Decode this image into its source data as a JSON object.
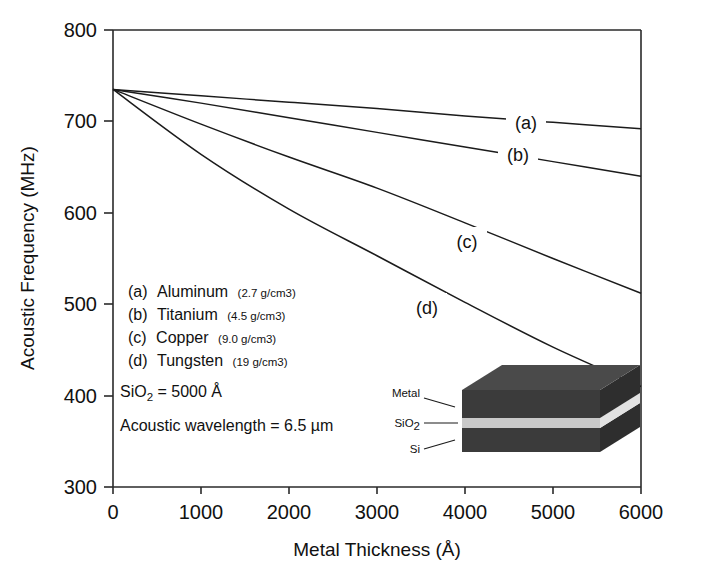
{
  "chart_data": {
    "type": "line",
    "title": "",
    "xlabel": "Metal Thickness (Å)",
    "ylabel": "Acoustic Frequency (MHz)",
    "xlim": [
      0,
      6000
    ],
    "ylim": [
      300,
      800
    ],
    "xticks": [
      "0",
      "1000",
      "2000",
      "3000",
      "4000",
      "5000",
      "6000"
    ],
    "xtick_values": [
      0,
      1000,
      2000,
      3000,
      4000,
      5000,
      6000
    ],
    "yticks": [
      "300",
      "400",
      "500",
      "600",
      "700",
      "800"
    ],
    "ytick_values": [
      300,
      400,
      500,
      600,
      700,
      800
    ],
    "grid": false,
    "legend_position": "inside-left",
    "x": [
      0,
      1000,
      2000,
      3000,
      4000,
      5000,
      6000
    ],
    "series": [
      {
        "name": "Aluminum",
        "key": "a",
        "label": "(a)",
        "density": "2.7 g/cm3",
        "values": [
          735,
          728,
          721,
          714,
          706,
          699,
          692
        ]
      },
      {
        "name": "Titanium",
        "key": "b",
        "label": "(b)",
        "density": "4.5 g/cm3",
        "values": [
          735,
          720,
          704,
          688,
          672,
          656,
          640
        ]
      },
      {
        "name": "Copper",
        "key": "c",
        "label": "(c)",
        "density": "9.0 g/cm3",
        "values": [
          735,
          697,
          661,
          627,
          589,
          550,
          512
        ]
      },
      {
        "name": "Tungsten",
        "key": "d",
        "label": "(d)",
        "density": "19 g/cm3",
        "values": [
          735,
          664,
          604,
          553,
          502,
          453,
          410
        ]
      }
    ],
    "annotations": {
      "oxide_thickness": "SiO2 = 5000 Å",
      "oxide_thickness_prefix": "SiO",
      "oxide_thickness_sub": "2",
      "oxide_thickness_suffix": " = 5000 Å",
      "acoustic_wavelength": "Acoustic wavelength  = 6.5 µm"
    }
  },
  "legend": {
    "entries": [
      {
        "marker": "(a)",
        "material": "Aluminum",
        "density": "(2.7 g/cm3)"
      },
      {
        "marker": "(b)",
        "material": "Titanium",
        "density": "(4.5 g/cm3)"
      },
      {
        "marker": "(c)",
        "material": "Copper",
        "density": "(9.0 g/cm3)"
      },
      {
        "marker": "(d)",
        "material": "Tungsten",
        "density": "(19 g/cm3)"
      }
    ]
  },
  "inset": {
    "name": "layer-stack-diagram",
    "labels": {
      "metal": "Metal",
      "oxide_prefix": "SiO",
      "oxide_sub": "2",
      "substrate": "Si"
    },
    "colors": {
      "metal": "#3b3b3b",
      "metal_top": "#4a4a4a",
      "oxide": "#c9c9c9",
      "substrate": "#3b3b3b",
      "side": "#2e2e2e"
    }
  },
  "curve_labels": {
    "a": "(a)",
    "b": "(b)",
    "c": "(c)",
    "d": "(d)"
  },
  "axis": {
    "x_title": "Metal Thickness (Å)",
    "y_title_prefix": "Acoustic Frequency (MHz)"
  },
  "colors": {
    "ink": "#1b1b1b",
    "frame": "#2a2a2a",
    "background": "#ffffff"
  }
}
